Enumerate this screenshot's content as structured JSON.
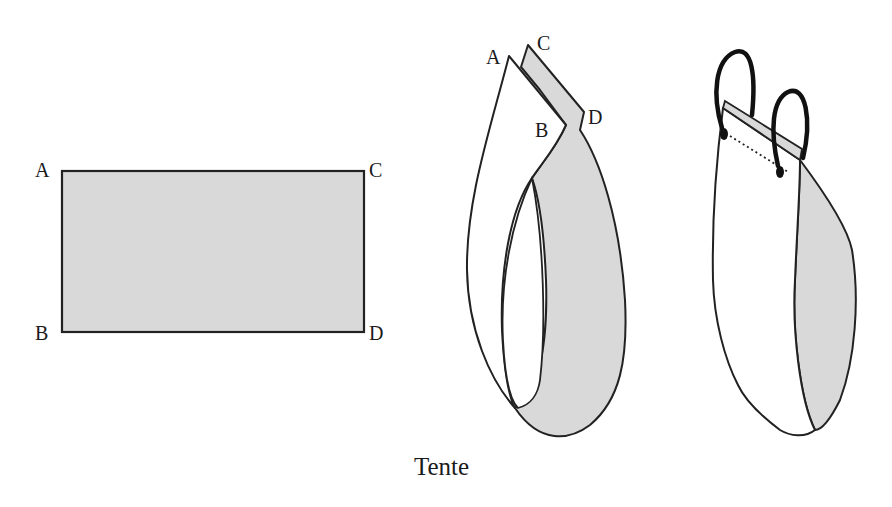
{
  "figure": {
    "caption": "Tente",
    "colors": {
      "fill": "#d9d9d9",
      "stroke": "#222222",
      "handle": "#111111",
      "background": "#ffffff"
    },
    "flat_sheet": {
      "labels": {
        "a": "A",
        "b": "B",
        "c": "C",
        "d": "D"
      }
    },
    "folded_sheet": {
      "labels": {
        "a": "A",
        "b": "B",
        "c": "C",
        "d": "D"
      }
    },
    "bag": {
      "handles": 2,
      "description": "finished bag with two ring handles"
    }
  }
}
